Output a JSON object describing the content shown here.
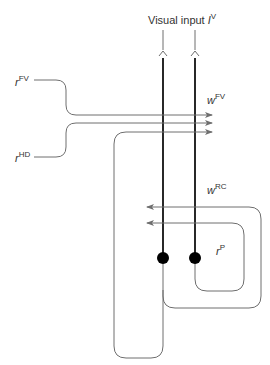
{
  "diagram": {
    "title": "Visual input",
    "title_var": "I",
    "title_sup": "V",
    "labels": {
      "r_fv": {
        "base": "r",
        "sup": "FV"
      },
      "r_hd": {
        "base": "r",
        "sup": "HD"
      },
      "w_fv": {
        "base": "w",
        "sup": "FV"
      },
      "w_rc": {
        "base": "w",
        "sup": "RC"
      },
      "r_p": {
        "base": "r",
        "sup": "P"
      }
    },
    "nodes": [
      {
        "id": "left-cell",
        "x": 163,
        "y": 258
      },
      {
        "id": "right-cell",
        "x": 195,
        "y": 258
      }
    ],
    "colors": {
      "thin_line": "#6e6e6e",
      "thick_line": "#111111",
      "node_fill": "#000000",
      "text": "#333333"
    }
  }
}
